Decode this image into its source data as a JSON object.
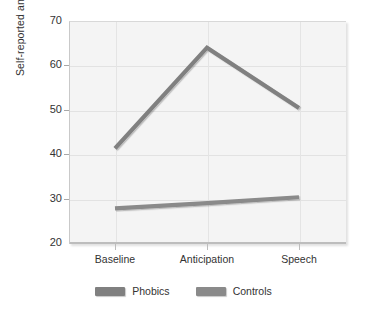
{
  "chart_data": {
    "type": "line",
    "title": "",
    "xlabel": "",
    "ylabel": "Self-reported anxiety",
    "categories": [
      "Baseline",
      "Anticipation",
      "Speech"
    ],
    "series": [
      {
        "name": "Phobics",
        "values": [
          41.3,
          64.0,
          50.4
        ],
        "color": "#808080"
      },
      {
        "name": "Controls",
        "values": [
          27.8,
          29.0,
          30.3
        ],
        "color": "#8a8a8a"
      }
    ],
    "ylim": [
      20,
      70
    ],
    "yticks": [
      20,
      30,
      40,
      50,
      60,
      70
    ],
    "ytick_labels": [
      "20",
      "30",
      "40",
      "50",
      "60",
      "70"
    ],
    "grid": "horizontal-and-vertical",
    "legend_position": "bottom-center",
    "plot_background": "#f4f4f4",
    "gridline_color": "#e2e2e2",
    "text_color": "#333333"
  },
  "legend": {
    "entries": [
      {
        "label": "Phobics"
      },
      {
        "label": "Controls"
      }
    ]
  }
}
